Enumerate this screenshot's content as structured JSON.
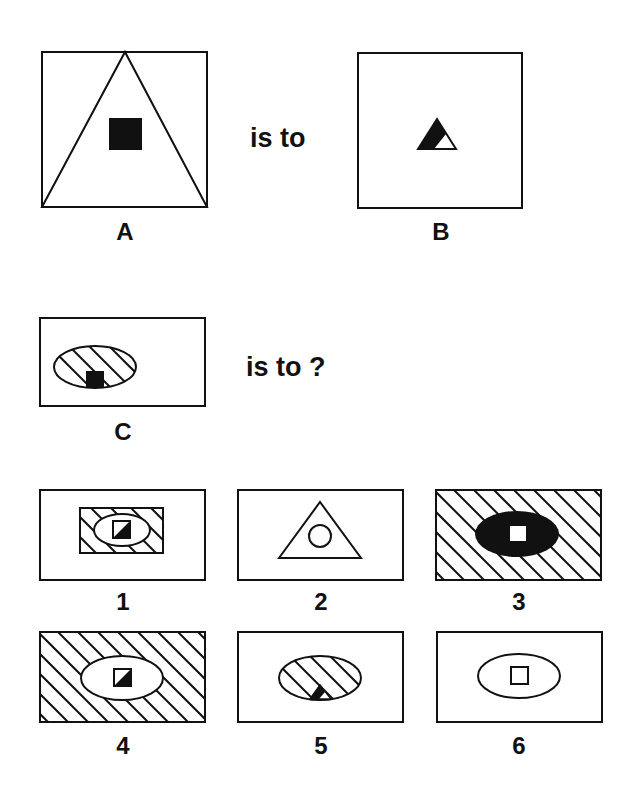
{
  "puzzle": {
    "phrase_1": "is to",
    "phrase_2": "is to ?",
    "figure_a": {
      "label": "A",
      "description": "square frame containing large triangle with small black square at center"
    },
    "figure_b": {
      "label": "B",
      "description": "square frame containing small triangle, left part black, right part white"
    },
    "figure_c": {
      "label": "C",
      "description": "rectangle containing hatched ellipse with small black square at bottom"
    },
    "options": [
      {
        "label": "1",
        "description": "hatched rectangle with white ellipse, half-black square"
      },
      {
        "label": "2",
        "description": "triangle with circle inside"
      },
      {
        "label": "3",
        "description": "fully hatched rectangle with black ellipse and white square"
      },
      {
        "label": "4",
        "description": "fully hatched rectangle with white ellipse and half-black square"
      },
      {
        "label": "5",
        "description": "hatched ellipse with half-black triangle at bottom"
      },
      {
        "label": "6",
        "description": "white ellipse with white square"
      }
    ]
  },
  "colors": {
    "ink": "#111111",
    "paper": "#ffffff"
  }
}
